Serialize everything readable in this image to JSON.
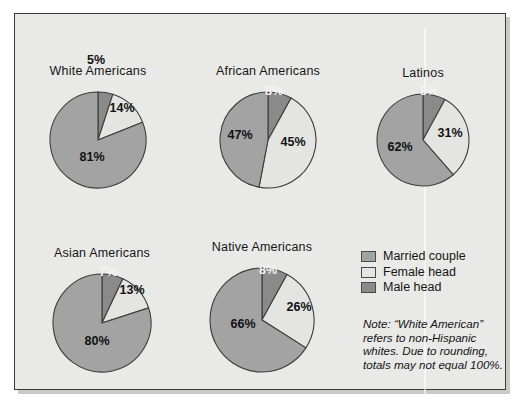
{
  "figure": {
    "background": "#e9e9e7",
    "border_color": "#3a3a3a"
  },
  "colors": {
    "married_couple": "#a3a3a3",
    "female_head": "#e4e4e2",
    "male_head": "#8a8a8a",
    "outline": "#3d3d3d",
    "label_dark": "#121212",
    "label_light": "#f4f4f4"
  },
  "legend": {
    "items": [
      {
        "label": "Married couple",
        "color": "#a3a3a3"
      },
      {
        "label": "Female head",
        "color": "#e4e4e2"
      },
      {
        "label": "Male head",
        "color": "#8a8a8a"
      }
    ]
  },
  "note": {
    "text": "Note: “White American” refers to non-Hispanic whites. Due to rounding, totals may not equal 100%."
  },
  "chart_data": {
    "type": "pie",
    "title": "",
    "legend_position": "bottom-right",
    "series_names": [
      "Married couple",
      "Female head",
      "Male head"
    ],
    "charts": [
      {
        "title": "White Americans",
        "cx": 98,
        "cy": 140,
        "r": 48,
        "slices": [
          {
            "name": "Male head",
            "value": 5,
            "label": "5%",
            "color": "#8a8a8a",
            "label_style": "dark",
            "lx": 96,
            "ly": 64
          },
          {
            "name": "Female head",
            "value": 14,
            "label": "14%",
            "color": "#e4e4e2",
            "label_style": "dark",
            "lx": 122,
            "ly": 112
          },
          {
            "name": "Married couple",
            "value": 81,
            "label": "81%",
            "color": "#a3a3a3",
            "label_style": "dark",
            "lx": 92,
            "ly": 161
          }
        ]
      },
      {
        "title": "African Americans",
        "cx": 268,
        "cy": 140,
        "r": 48,
        "slices": [
          {
            "name": "Male head",
            "value": 8,
            "label": "8%",
            "color": "#8a8a8a",
            "label_style": "light",
            "lx": 274,
            "ly": 95
          },
          {
            "name": "Female head",
            "value": 45,
            "label": "45%",
            "color": "#e4e4e2",
            "label_style": "dark",
            "lx": 293,
            "ly": 146
          },
          {
            "name": "Married couple",
            "value": 47,
            "label": "47%",
            "color": "#a3a3a3",
            "label_style": "dark",
            "lx": 240,
            "ly": 139
          }
        ]
      },
      {
        "title": "Latinos",
        "cx": 423,
        "cy": 140,
        "r": 46,
        "slices": [
          {
            "name": "Male head",
            "value": 8,
            "label": "8%",
            "color": "#8a8a8a",
            "label_style": "light",
            "lx": 429,
            "ly": 95
          },
          {
            "name": "Female head",
            "value": 31,
            "label": "31%",
            "color": "#e4e4e2",
            "label_style": "dark",
            "lx": 450,
            "ly": 137
          },
          {
            "name": "Married couple",
            "value": 62,
            "label": "62%",
            "color": "#a3a3a3",
            "label_style": "dark",
            "lx": 400,
            "ly": 151
          }
        ]
      },
      {
        "title": "Asian Americans",
        "cx": 102,
        "cy": 323,
        "r": 49,
        "slices": [
          {
            "name": "Male head",
            "value": 7,
            "label": "7%",
            "color": "#8a8a8a",
            "label_style": "light",
            "lx": 108,
            "ly": 276
          },
          {
            "name": "Female head",
            "value": 13,
            "label": "13%",
            "color": "#e4e4e2",
            "label_style": "dark",
            "lx": 132,
            "ly": 294
          },
          {
            "name": "Married couple",
            "value": 80,
            "label": "80%",
            "color": "#a3a3a3",
            "label_style": "dark",
            "lx": 97,
            "ly": 345
          }
        ]
      },
      {
        "title": "Native Americans",
        "cx": 262,
        "cy": 320,
        "r": 52,
        "slices": [
          {
            "name": "Male head",
            "value": 8,
            "label": "8%",
            "color": "#8a8a8a",
            "label_style": "light",
            "lx": 268,
            "ly": 274
          },
          {
            "name": "Female head",
            "value": 26,
            "label": "26%",
            "color": "#e4e4e2",
            "label_style": "dark",
            "lx": 299,
            "ly": 311
          },
          {
            "name": "Married couple",
            "value": 66,
            "label": "66%",
            "color": "#a3a3a3",
            "label_style": "dark",
            "lx": 243,
            "ly": 328
          }
        ]
      }
    ]
  }
}
